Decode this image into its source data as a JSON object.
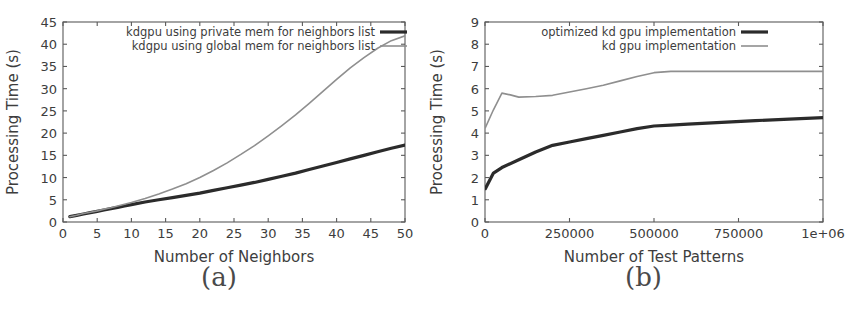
{
  "figure": {
    "panels": [
      {
        "subcaption": "(a)",
        "chart_data": {
          "type": "line",
          "title": "",
          "xlabel": "Number of Neighbors",
          "ylabel": "Processing Time (s)",
          "xlim": [
            0,
            50
          ],
          "ylim": [
            0,
            45
          ],
          "xticks": [
            0,
            5,
            10,
            15,
            20,
            25,
            30,
            35,
            40,
            45,
            50
          ],
          "xtick_labels": [
            "0",
            "5",
            "10",
            "15",
            "20",
            "25",
            "30",
            "35",
            "40",
            "45",
            "50"
          ],
          "yticks": [
            0,
            5,
            10,
            15,
            20,
            25,
            30,
            35,
            40,
            45
          ],
          "ytick_labels": [
            "0",
            "5",
            "10",
            "15",
            "20",
            "25",
            "30",
            "35",
            "40",
            "45"
          ],
          "grid": false,
          "legend_position": "upper left",
          "series": [
            {
              "name": "kdgpu using private mem for neighbors list",
              "color": "#2b2b2b",
              "width": 3.2,
              "x": [
                1,
                2,
                3,
                4,
                5,
                6,
                7,
                8,
                9,
                10,
                12,
                14,
                16,
                18,
                20,
                22,
                24,
                26,
                28,
                30,
                32,
                34,
                36,
                38,
                40,
                42,
                44,
                46,
                48,
                50
              ],
              "y": [
                1.2,
                1.5,
                1.8,
                2.1,
                2.4,
                2.7,
                3.0,
                3.3,
                3.6,
                3.9,
                4.5,
                5.0,
                5.5,
                6.0,
                6.5,
                7.1,
                7.7,
                8.3,
                8.9,
                9.6,
                10.3,
                11.0,
                11.8,
                12.6,
                13.4,
                14.2,
                15.0,
                15.8,
                16.6,
                17.3
              ]
            },
            {
              "name": "kdgpu using global mem for neighbors list",
              "color": "#8f8f8f",
              "width": 1.6,
              "x": [
                1,
                2,
                3,
                4,
                5,
                6,
                7,
                8,
                9,
                10,
                12,
                14,
                16,
                18,
                20,
                22,
                24,
                26,
                28,
                30,
                32,
                34,
                36,
                38,
                40,
                42,
                44,
                46,
                48,
                50
              ],
              "y": [
                1.2,
                1.5,
                1.9,
                2.2,
                2.5,
                2.9,
                3.2,
                3.6,
                4.0,
                4.4,
                5.3,
                6.3,
                7.4,
                8.6,
                10.0,
                11.6,
                13.3,
                15.2,
                17.2,
                19.4,
                21.7,
                24.1,
                26.7,
                29.4,
                32.1,
                34.7,
                37.0,
                39.1,
                40.8,
                41.9
              ]
            }
          ]
        }
      },
      {
        "subcaption": "(b)",
        "chart_data": {
          "type": "line",
          "title": "",
          "xlabel": "Number of Test Patterns",
          "ylabel": "Processing Time (s)",
          "xlim": [
            0,
            1000000
          ],
          "ylim": [
            0,
            9
          ],
          "xticks": [
            0,
            250000,
            500000,
            750000,
            1000000
          ],
          "xtick_labels": [
            "0",
            "250000",
            "500000",
            "750000",
            "1e+06"
          ],
          "yticks": [
            0,
            1,
            2,
            3,
            4,
            5,
            6,
            7,
            8,
            9
          ],
          "ytick_labels": [
            "0",
            "1",
            "2",
            "3",
            "4",
            "5",
            "6",
            "7",
            "8",
            "9"
          ],
          "grid": false,
          "legend_position": "upper center",
          "series": [
            {
              "name": "optimized kd gpu implementation",
              "color": "#2b2b2b",
              "width": 3.2,
              "x": [
                1000,
                25000,
                50000,
                100000,
                150000,
                200000,
                250000,
                300000,
                350000,
                400000,
                450000,
                500000,
                550000,
                600000,
                700000,
                800000,
                900000,
                1000000
              ],
              "y": [
                1.5,
                2.2,
                2.45,
                2.8,
                3.15,
                3.45,
                3.6,
                3.75,
                3.9,
                4.05,
                4.2,
                4.32,
                4.36,
                4.4,
                4.48,
                4.56,
                4.63,
                4.7
              ]
            },
            {
              "name": "kd gpu implementation",
              "color": "#8f8f8f",
              "width": 1.6,
              "x": [
                1000,
                25000,
                50000,
                75000,
                100000,
                150000,
                200000,
                250000,
                300000,
                350000,
                400000,
                450000,
                500000,
                550000,
                600000,
                700000,
                800000,
                900000,
                1000000
              ],
              "y": [
                4.25,
                5.05,
                5.8,
                5.72,
                5.62,
                5.65,
                5.7,
                5.85,
                6.0,
                6.15,
                6.35,
                6.55,
                6.72,
                6.78,
                6.78,
                6.78,
                6.78,
                6.78,
                6.78
              ]
            }
          ]
        }
      }
    ]
  },
  "colors": {
    "background": "#ffffff",
    "axis": "#5a5a5a",
    "text": "#3d3d3d",
    "series_dark": "#2b2b2b",
    "series_light": "#8f8f8f"
  }
}
